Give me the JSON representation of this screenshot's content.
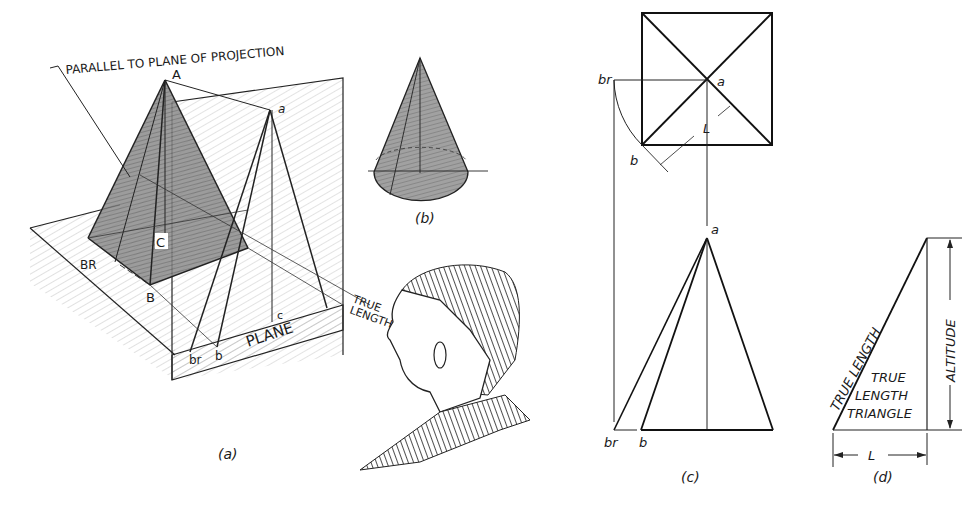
{
  "figure": {
    "panel_a": {
      "caption": "(a)",
      "labels": {
        "callout": "PARALLEL TO PLANE OF PROJECTION",
        "apex_A": "A",
        "apex_a": "a",
        "point_C": "C",
        "point_c": "c",
        "point_BR": "BR",
        "point_B": "B",
        "point_br": "br",
        "point_b": "b",
        "plane": "PLANE",
        "true": "TRUE",
        "length": "LENGTH"
      }
    },
    "panel_b": {
      "caption": "(b)"
    },
    "panel_c": {
      "caption": "(c)",
      "labels": {
        "top_a": "a",
        "top_br": "br",
        "top_b": "b",
        "top_L": "L",
        "front_a": "a",
        "front_br": "br",
        "front_b": "b"
      }
    },
    "panel_d": {
      "caption": "(d)",
      "labels": {
        "hyp": "TRUE LENGTH",
        "t1": "TRUE",
        "t2": "LENGTH",
        "t3": "TRIANGLE",
        "altitude": "ALTITUDE",
        "L": "L"
      }
    }
  }
}
